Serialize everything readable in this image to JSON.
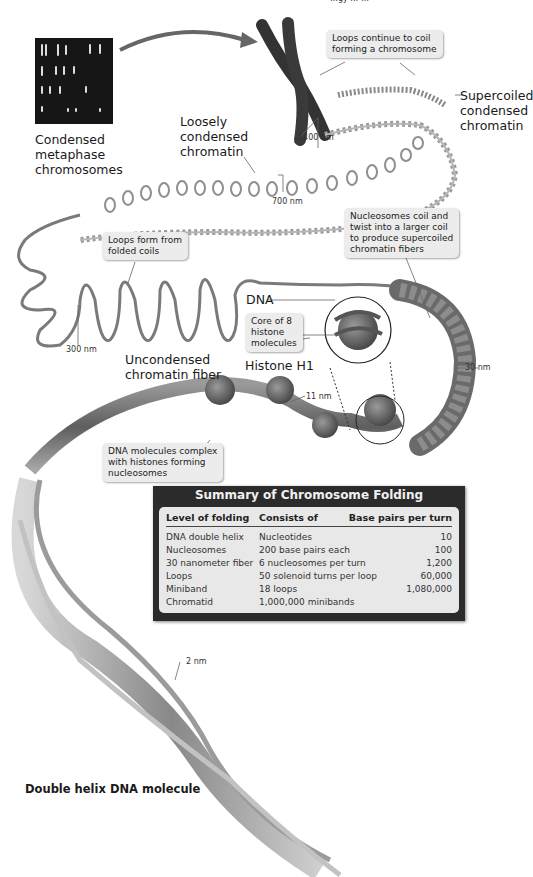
{
  "header_fragment": "…gy … …",
  "labels": {
    "condensed_metaphase": [
      "Condensed",
      "metaphase",
      "chromosomes"
    ],
    "loosely_condensed": [
      "Loosely",
      "condensed",
      "chromatin"
    ],
    "supercoiled": [
      "Supercoiled",
      "condensed",
      "chromatin"
    ],
    "unconcondensed": [
      "Uncondensed",
      "chromatin fiber"
    ],
    "dna": "DNA",
    "histone_h1": "Histone H1",
    "double_helix": "Double helix DNA molecule"
  },
  "callouts": {
    "loops_continue": [
      "Loops continue to coil",
      "forming a chromosome"
    ],
    "loops_form": [
      "Loops form from",
      "folded coils"
    ],
    "nucleosomes_coil": [
      "Nucleosomes coil and",
      "twist into a larger coil",
      "to produce supercoiled",
      "chromatin fibers"
    ],
    "core_histone": [
      "Core of 8",
      "histone",
      "molecules"
    ],
    "dna_complex": [
      "DNA molecules complex",
      "with histones forming",
      "nucleosomes"
    ]
  },
  "measurements": {
    "m1400": "1400 nm",
    "m700": "700 nm",
    "m300": "300 nm",
    "m30": "30 nm",
    "m11": "11 nm",
    "m2": "2 nm"
  },
  "summary_table": {
    "title": "Summary of Chromosome Folding",
    "headers": [
      "Level of folding",
      "Consists of",
      "Base pairs per turn"
    ],
    "rows": [
      [
        "DNA double helix",
        "Nucleotides",
        "10"
      ],
      [
        "Nucleosomes",
        "200 base pairs each",
        "100"
      ],
      [
        "30 nanometer fiber",
        "6 nucleosomes per turn",
        "1,200"
      ],
      [
        "Loops",
        "50 solenoid turns per loop",
        "60,000"
      ],
      [
        "Miniband",
        "18 loops",
        "1,080,000"
      ],
      [
        "Chromatid",
        "1,000,000 minibands",
        ""
      ]
    ]
  },
  "colors": {
    "chromatin": "#8a8a8a",
    "chromosome": "#3a3a3a",
    "callout_bg": "#ececec",
    "table_frame": "#2b2b2b",
    "table_inner": "#e8e8e8"
  }
}
